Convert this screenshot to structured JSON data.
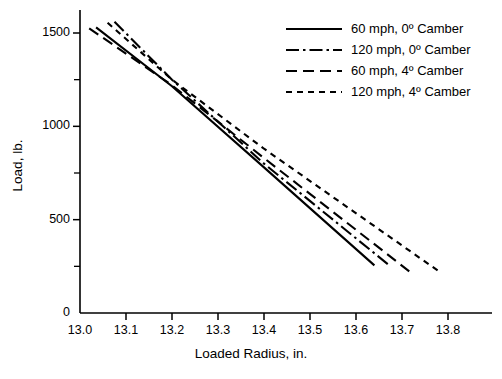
{
  "chart_data": {
    "type": "line",
    "title": "",
    "xlabel": "Loaded Radius, in.",
    "ylabel": "Load, lb.",
    "xlim": [
      13.0,
      13.85
    ],
    "ylim": [
      0,
      1560
    ],
    "grid": false,
    "legend_position": "top-right",
    "xticks": [
      "13.0",
      "13.1",
      "13.2",
      "13.3",
      "13.4",
      "13.5",
      "13.6",
      "13.7",
      "13.8"
    ],
    "xtick_values": [
      13.0,
      13.1,
      13.2,
      13.3,
      13.4,
      13.5,
      13.6,
      13.7,
      13.8
    ],
    "yticks": [
      "0",
      "500",
      "1000",
      "1500"
    ],
    "ytick_values": [
      0,
      500,
      1000,
      1500
    ],
    "yminor_values": [
      250,
      750,
      1250
    ],
    "series": [
      {
        "name": "60 mph, 0º Camber",
        "style": "solid",
        "x": [
          13.035,
          13.64
        ],
        "y": [
          1530,
          255
        ],
        "points": [
          {
            "x": 13.035,
            "y": 1530
          },
          {
            "x": 13.2,
            "y": 1215
          },
          {
            "x": 13.4,
            "y": 780
          },
          {
            "x": 13.64,
            "y": 255
          }
        ]
      },
      {
        "name": "120 mph, 0º Camber",
        "style": "dash-dot",
        "x": [
          13.075,
          13.675
        ],
        "y": [
          1560,
          250
        ],
        "points": [
          {
            "x": 13.075,
            "y": 1560
          },
          {
            "x": 13.2,
            "y": 1250
          },
          {
            "x": 13.4,
            "y": 800
          },
          {
            "x": 13.675,
            "y": 250
          }
        ]
      },
      {
        "name": "60 mph, 4º Camber",
        "style": "long-dash",
        "x": [
          13.02,
          13.72
        ],
        "y": [
          1525,
          215
        ],
        "points": [
          {
            "x": 13.02,
            "y": 1525
          },
          {
            "x": 13.2,
            "y": 1220
          },
          {
            "x": 13.4,
            "y": 830
          },
          {
            "x": 13.72,
            "y": 215
          }
        ]
      },
      {
        "name": "120 mph, 4º Camber",
        "style": "short-dash",
        "x": [
          13.06,
          13.785
        ],
        "y": [
          1555,
          215
        ],
        "points": [
          {
            "x": 13.06,
            "y": 1555
          },
          {
            "x": 13.2,
            "y": 1250
          },
          {
            "x": 13.4,
            "y": 880
          },
          {
            "x": 13.785,
            "y": 215
          }
        ]
      }
    ]
  },
  "axes": {
    "x_title": "Loaded Radius, in.",
    "y_title": "Load, lb."
  },
  "legend": {
    "entries": [
      {
        "label": "60 mph, 0º Camber",
        "style": "solid"
      },
      {
        "label": "120 mph, 0º Camber",
        "style": "dash-dot"
      },
      {
        "label": "60 mph, 4º Camber",
        "style": "long-dash"
      },
      {
        "label": "120 mph, 4º Camber",
        "style": "short-dash"
      }
    ]
  },
  "colors": {
    "line": "#000000",
    "axis": "#000000",
    "background": "#ffffff"
  }
}
